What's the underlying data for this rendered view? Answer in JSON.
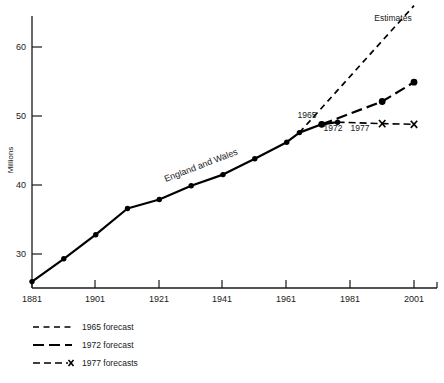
{
  "chart_data": {
    "type": "line",
    "title": "",
    "xlabel": "",
    "ylabel": "Millions",
    "xlim": [
      1881,
      2001
    ],
    "ylim": [
      25,
      66
    ],
    "grid": false,
    "legend_position": "below-left",
    "y_ticks": [
      "30",
      "40",
      "50",
      "60"
    ],
    "y_tick_values": [
      30,
      40,
      50,
      60
    ],
    "x_ticks": [
      "1881",
      "1901",
      "1921",
      "1941",
      "1961",
      "1981",
      "2001"
    ],
    "x_tick_values": [
      1881,
      1901,
      1921,
      1941,
      1961,
      1981,
      2001
    ],
    "annotations": [
      {
        "text": "England and Wales",
        "x": 1936,
        "y": 43.5,
        "rotation": -21
      },
      {
        "text": "Estimates",
        "x": 1981,
        "y": 64.5,
        "rotation": 0
      },
      {
        "text": "1965",
        "x": 1963,
        "y": 49.4,
        "rotation": 0
      },
      {
        "text": "1972",
        "x": 1972,
        "y": 47.6,
        "rotation": 0
      },
      {
        "text": "1977",
        "x": 1978,
        "y": 47.6,
        "rotation": 0
      }
    ],
    "series": [
      {
        "name": "England and Wales",
        "style": "solid",
        "markers": "filled-circle",
        "x": [
          1881,
          1891,
          1901,
          1911,
          1921,
          1931,
          1941,
          1951,
          1961,
          1965,
          1972,
          1977
        ],
        "values": [
          26.0,
          29.3,
          32.8,
          36.6,
          37.9,
          39.9,
          41.5,
          43.8,
          46.2,
          47.6,
          48.8,
          49.1
        ]
      },
      {
        "name": "1965 forecast",
        "style": "dashed",
        "markers": "none",
        "x": [
          1965,
          2001
        ],
        "values": [
          47.6,
          66.0
        ]
      },
      {
        "name": "1972 forecast",
        "style": "long-dashed",
        "markers": "filled-circle",
        "x": [
          1972,
          1991,
          2001
        ],
        "values": [
          48.8,
          52.1,
          54.9
        ]
      },
      {
        "name": "1977 forecasts",
        "style": "dashed-x",
        "markers": "x-cross",
        "x": [
          1977,
          1991,
          2001
        ],
        "values": [
          49.1,
          48.9,
          48.8
        ]
      }
    ]
  },
  "legend": {
    "items": [
      {
        "label": "1965 forecast",
        "style": "dashed"
      },
      {
        "label": "1972 forecast",
        "style": "long-dashed"
      },
      {
        "label": "1977 forecasts",
        "style": "dashed-x"
      }
    ]
  }
}
